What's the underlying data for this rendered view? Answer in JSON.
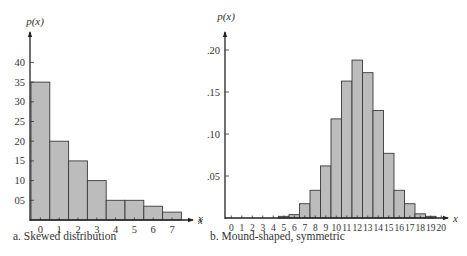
{
  "chart_data": [
    {
      "type": "bar",
      "title": "",
      "caption": "a. Skewed distribution",
      "xlabel": "x",
      "ylabel": "p(x)",
      "categories": [
        "0",
        "1",
        "2",
        "3",
        "4",
        "5",
        "6",
        "7"
      ],
      "values": [
        35,
        20,
        15,
        10,
        5,
        5,
        3.5,
        2
      ],
      "yticks": [
        {
          "value": 5,
          "label": "05"
        },
        {
          "value": 10,
          "label": "10"
        },
        {
          "value": 15,
          "label": "15"
        },
        {
          "value": 20,
          "label": "20"
        },
        {
          "value": 25,
          "label": "25"
        },
        {
          "value": 30,
          "label": "30"
        },
        {
          "value": 35,
          "label": "35"
        },
        {
          "value": 40,
          "label": "40"
        }
      ],
      "ylim": [
        0,
        45
      ],
      "grid": false,
      "legend": null,
      "bar_color": "#bcbcbc",
      "edge_color": "#3a3a3a"
    },
    {
      "type": "bar",
      "title": "",
      "caption": "b. Mound-shaped, symmetric",
      "xlabel": "x",
      "ylabel": "p(x)",
      "categories": [
        "0",
        "1",
        "2",
        "3",
        "4",
        "5",
        "6",
        "7",
        "8",
        "9",
        "10",
        "11",
        "12",
        "13",
        "14",
        "15",
        "16",
        "17",
        "18",
        "19",
        "20"
      ],
      "values": [
        0,
        0,
        0,
        0,
        0,
        0.002,
        0.004,
        0.017,
        0.033,
        0.062,
        0.118,
        0.163,
        0.188,
        0.173,
        0.128,
        0.077,
        0.033,
        0.017,
        0.005,
        0.002,
        0
      ],
      "yticks": [
        {
          "value": 0.05,
          "label": ".05"
        },
        {
          "value": 0.1,
          "label": ".10"
        },
        {
          "value": 0.15,
          "label": ".15"
        },
        {
          "value": 0.2,
          "label": ".20"
        }
      ],
      "ylim": [
        0,
        0.22
      ],
      "grid": false,
      "legend": null,
      "bar_color": "#bcbcbc",
      "edge_color": "#3a3a3a"
    }
  ],
  "stray_label": "x"
}
